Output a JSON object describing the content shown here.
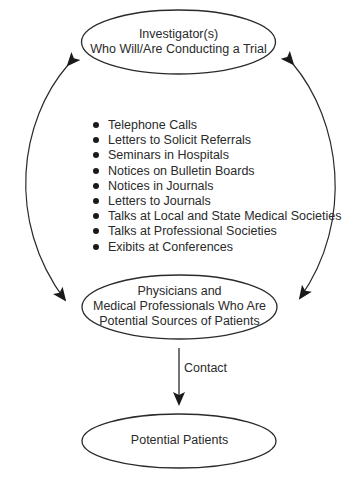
{
  "diagram": {
    "nodes": {
      "investigators": {
        "lines": [
          "Investigator(s)",
          "Who Will/Are Conducting a Trial"
        ]
      },
      "physicians": {
        "lines": [
          "Physicians and",
          "Medical Professionals Who Are",
          "Potential Sources of Patients"
        ]
      },
      "patients": {
        "lines": [
          "Potential Patients"
        ]
      }
    },
    "channels": [
      "Telephone Calls",
      "Letters to Solicit Referrals",
      "Seminars in Hospitals",
      "Notices on Bulletin Boards",
      "Notices in Journals",
      "Letters to Journals",
      "Talks at Local and State Medical Societies",
      "Talks at Professional Societies",
      "Exibits at Conferences"
    ],
    "edges": {
      "contact_label": "Contact"
    },
    "colors": {
      "stroke": "#2a2a2a",
      "text": "#2a2a2a",
      "background": "#ffffff"
    }
  }
}
